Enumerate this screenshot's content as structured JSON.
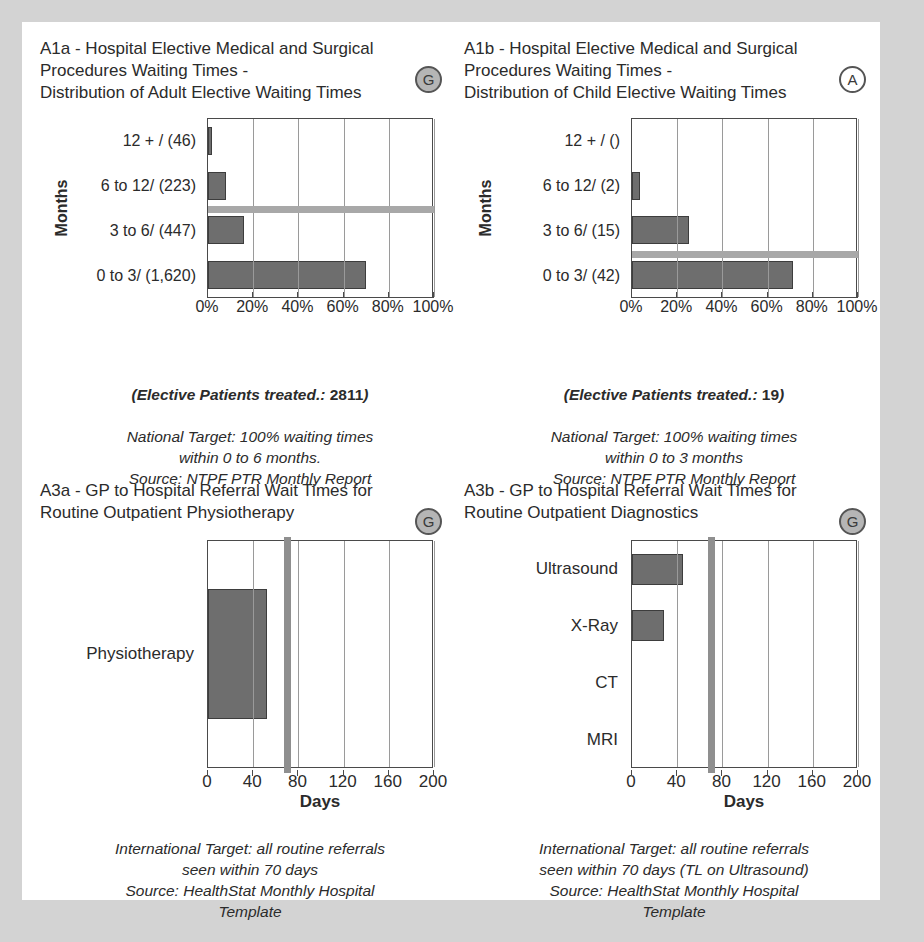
{
  "page": {
    "background": "#d3d3d3",
    "paper": "#ffffff",
    "bar_fill": "#6e6e6e",
    "target_line": "#a8a8a8"
  },
  "panels": {
    "a1a": {
      "title": "A1a - Hospital Elective Medical and Surgical\nProcedures Waiting Times -\nDistribution of Adult Elective Waiting Times",
      "badge": "G",
      "badge_style": "grey-filled",
      "caption_strong_label": "(Elective Patients treated.: ",
      "caption_strong_value": "2811",
      "caption_strong_close": ")",
      "caption_rest": "National Target: 100% waiting times\nwithin 0 to 6 months.\nSource: NTPF PTR Monthly Report"
    },
    "a1b": {
      "title": "A1b - Hospital Elective Medical and Surgical\nProcedures Waiting Times -\nDistribution of Child Elective Waiting Times",
      "badge": "A",
      "badge_style": "white-filled",
      "caption_strong_label": "(Elective Patients treated.: ",
      "caption_strong_value": "19",
      "caption_strong_close": ")",
      "caption_rest": "National Target: 100% waiting times\nwithin 0 to 3 months\nSource: NTPF PTR Monthly Report"
    },
    "a3a": {
      "title": "A3a - GP to Hospital Referral Wait Times for\nRoutine Outpatient Physiotherapy",
      "badge": "G",
      "badge_style": "grey-filled",
      "caption_rest": "International Target: all routine referrals\nseen within 70 days\nSource: HealthStat Monthly Hospital\nTemplate"
    },
    "a3b": {
      "title": "A3b - GP to Hospital Referral Wait Times for\nRoutine Outpatient Diagnostics",
      "badge": "G",
      "badge_style": "grey-filled",
      "caption_rest": "International Target: all routine referrals\nseen within 70 days (TL on Ultrasound)\nSource: HealthStat Monthly Hospital\nTemplate"
    }
  },
  "chart_data": [
    {
      "id": "a1a",
      "type": "bar",
      "orientation": "horizontal",
      "title": "A1a - Hospital Elective Medical and Surgical Procedures Waiting Times - Distribution of Adult Elective Waiting Times",
      "ylabel": "Months",
      "xlabel": "",
      "categories": [
        "12 + / (46)",
        "6 to 12/ (223)",
        "3 to 6/ (447)",
        "0 to 3/ (1,620)"
      ],
      "counts": [
        46,
        223,
        447,
        1620
      ],
      "values": [
        1.6,
        7.9,
        15.9,
        70.0
      ],
      "value_unit": "%",
      "xlim": [
        0,
        100
      ],
      "xticks": [
        0,
        20,
        40,
        60,
        80,
        100
      ],
      "xticklabels": [
        "0%",
        "20%",
        "40%",
        "60%",
        "80%",
        "100%"
      ],
      "grid": true,
      "target_line": {
        "orientation": "horizontal",
        "between": [
          "6 to 12/ (223)",
          "3 to 6/ (447)"
        ],
        "label": "National Target: 100% within 0 to 6 months"
      },
      "total_treated": 2811
    },
    {
      "id": "a1b",
      "type": "bar",
      "orientation": "horizontal",
      "title": "A1b - Hospital Elective Medical and Surgical Procedures Waiting Times - Distribution of Child Elective Waiting Times",
      "ylabel": "Months",
      "xlabel": "",
      "categories": [
        "12 + / ()",
        "6 to 12/ (2)",
        "3 to 6/ (15)",
        "0 to 3/ (42)"
      ],
      "counts": [
        0,
        2,
        15,
        42
      ],
      "values": [
        0,
        3.4,
        25.4,
        71.2
      ],
      "value_unit": "%",
      "xlim": [
        0,
        100
      ],
      "xticks": [
        0,
        20,
        40,
        60,
        80,
        100
      ],
      "xticklabels": [
        "0%",
        "20%",
        "40%",
        "60%",
        "80%",
        "100%"
      ],
      "grid": true,
      "target_line": {
        "orientation": "horizontal",
        "between": [
          "3 to 6/ (15)",
          "0 to 3/ (42)"
        ],
        "label": "National Target: 100% within 0 to 3 months"
      },
      "total_treated": 19
    },
    {
      "id": "a3a",
      "type": "bar",
      "orientation": "horizontal",
      "title": "A3a - GP to Hospital Referral Wait Times for Routine Outpatient Physiotherapy",
      "xlabel": "Days",
      "ylabel": "",
      "categories": [
        "Physiotherapy"
      ],
      "values": [
        52
      ],
      "value_unit": "days",
      "xlim": [
        0,
        200
      ],
      "xticks": [
        0,
        40,
        80,
        120,
        160,
        200
      ],
      "xticklabels": [
        "0",
        "40",
        "80",
        "120",
        "160",
        "200"
      ],
      "grid": true,
      "target_line": {
        "orientation": "vertical",
        "value": 70,
        "label": "International Target: 70 days"
      }
    },
    {
      "id": "a3b",
      "type": "bar",
      "orientation": "horizontal",
      "title": "A3b - GP to Hospital Referral Wait Times for Routine Outpatient Diagnostics",
      "xlabel": "Days",
      "ylabel": "",
      "categories": [
        "Ultrasound",
        "X-Ray",
        "CT",
        "MRI"
      ],
      "values": [
        45,
        28,
        0,
        0
      ],
      "value_unit": "days",
      "xlim": [
        0,
        200
      ],
      "xticks": [
        0,
        40,
        80,
        120,
        160,
        200
      ],
      "xticklabels": [
        "0",
        "40",
        "80",
        "120",
        "160",
        "200"
      ],
      "grid": true,
      "target_line": {
        "orientation": "vertical",
        "value": 70,
        "label": "International Target: 70 days (TL on Ultrasound)"
      }
    }
  ]
}
